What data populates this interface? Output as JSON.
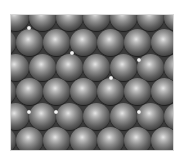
{
  "figure": {
    "description": "Close-packed layer of spheres (atomic surface model) with small bright interstitial spots",
    "background_color": "#3b3b3b",
    "sphere_diameter": 27,
    "rows": [
      {
        "y": 2,
        "xs": [
          4,
          31,
          58,
          85,
          112,
          139,
          166
        ]
      },
      {
        "y": 27,
        "xs": [
          -9,
          18,
          45,
          72,
          99,
          126,
          153
        ]
      },
      {
        "y": 52,
        "xs": [
          4,
          31,
          58,
          85,
          112,
          139,
          166
        ]
      },
      {
        "y": 76,
        "xs": [
          -9,
          18,
          45,
          72,
          99,
          126,
          153
        ]
      },
      {
        "y": 101,
        "xs": [
          4,
          31,
          58,
          85,
          112,
          139,
          166
        ]
      },
      {
        "y": 125,
        "xs": [
          -9,
          18,
          45,
          72,
          99,
          126,
          153
        ]
      }
    ],
    "bright_spots": [
      {
        "x": 18,
        "y": 13
      },
      {
        "x": 61,
        "y": 38
      },
      {
        "x": 128,
        "y": 45
      },
      {
        "x": 100,
        "y": 63
      },
      {
        "x": 18,
        "y": 97
      },
      {
        "x": 45,
        "y": 97
      },
      {
        "x": 128,
        "y": 97
      }
    ]
  }
}
